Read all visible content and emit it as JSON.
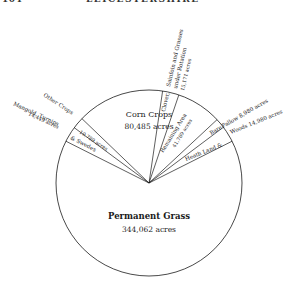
{
  "header": {
    "page_number": "104",
    "running_title": "LEICESTERSHIRE"
  },
  "chart_data": {
    "type": "pie",
    "title": "",
    "unit": "acres",
    "slices": [
      {
        "name": "Permanent Grass",
        "value": 344062,
        "label_lines": [
          "Permanent Grass",
          "344,062 acres"
        ]
      },
      {
        "name": "Mangold, Turnips & Swedes",
        "value": 14449,
        "label_lines": [
          "Mangold, Turnips",
          "14,449 acres"
        ],
        "inner_label": "& Swedes"
      },
      {
        "name": "Other Crops",
        "value": 10789,
        "label_lines": [
          "Other Crops"
        ],
        "inner_label": "10,789 acres"
      },
      {
        "name": "Corn Crops",
        "value": 80485,
        "label_lines": [
          "Corn Crops",
          "80,485 acres"
        ]
      },
      {
        "name": "Clover, Sainfoin and Grasses under Rotation",
        "value": 15171,
        "label_lines": [
          "Sainfoin and Grasses",
          "under Rotation",
          "15,171 acres"
        ],
        "inner_label": "Clover,"
      },
      {
        "name": "Remaining Area",
        "value": 41769,
        "label_lines": [
          "Remaining Area",
          "41,769 acres"
        ]
      },
      {
        "name": "Bare Fallow",
        "value": 8980,
        "label_lines": [
          "Fallow 8,980 acres"
        ],
        "inner_label": "Bare"
      },
      {
        "name": "Heath Land & Woods",
        "value": 14980,
        "label_lines": [
          "Woods 14,980 acres"
        ],
        "inner_label": "Heath Land &"
      }
    ],
    "colors": {
      "stroke": "#1a1a1a",
      "fill": "#ffffff"
    }
  }
}
